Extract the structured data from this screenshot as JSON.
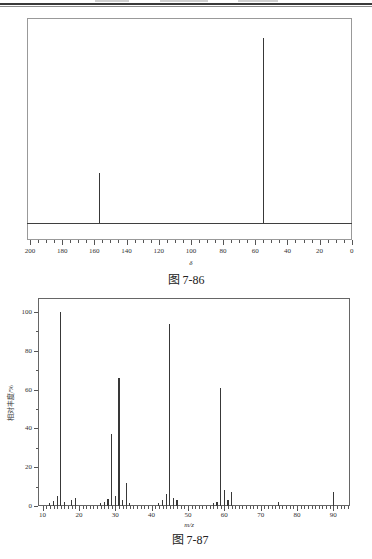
{
  "page": {
    "caption_nmr": "图 7-86",
    "caption_ms": "图 7-87"
  },
  "chart_data": [
    {
      "type": "line",
      "name": "carbon-13-nmr-spectrum",
      "title": "",
      "xlabel": "δ",
      "ylabel": "",
      "caption": "图 7-86",
      "x_axis": {
        "min": 0,
        "max": 200,
        "reversed": true,
        "major_step": 20,
        "minor_step": 5,
        "major_tick_labels": [
          "200",
          "180",
          "160",
          "140",
          "120",
          "100",
          "80",
          "60",
          "40",
          "20",
          "0"
        ]
      },
      "peaks": [
        {
          "x": 157,
          "rel_intensity": 27
        },
        {
          "x": 55,
          "rel_intensity": 100
        }
      ],
      "baseline": true,
      "grid": false,
      "frame": true
    },
    {
      "type": "bar",
      "name": "mass-spectrum",
      "title": "",
      "xlabel": "m/z",
      "ylabel": "相对丰度/%",
      "caption": "图 7-87",
      "x_axis": {
        "min": 10,
        "max": 94,
        "major_step": 10,
        "minor_step": 1,
        "major_tick_labels": [
          "10",
          "20",
          "30",
          "40",
          "50",
          "60",
          "70",
          "80",
          "90"
        ]
      },
      "y_axis": {
        "min": 0,
        "max": 106,
        "major_step": 20,
        "minor_step": 10,
        "major_tick_labels": [
          "0",
          "20",
          "40",
          "60",
          "80",
          "100"
        ]
      },
      "peaks": [
        {
          "mz": 12,
          "intensity": 1.5
        },
        {
          "mz": 13,
          "intensity": 2.5
        },
        {
          "mz": 14,
          "intensity": 5
        },
        {
          "mz": 15,
          "intensity": 100
        },
        {
          "mz": 16,
          "intensity": 2
        },
        {
          "mz": 18,
          "intensity": 3
        },
        {
          "mz": 19,
          "intensity": 4
        },
        {
          "mz": 26,
          "intensity": 1.5
        },
        {
          "mz": 27,
          "intensity": 2
        },
        {
          "mz": 28,
          "intensity": 3.5
        },
        {
          "mz": 29,
          "intensity": 37
        },
        {
          "mz": 30,
          "intensity": 5
        },
        {
          "mz": 31,
          "intensity": 66
        },
        {
          "mz": 32,
          "intensity": 3
        },
        {
          "mz": 33,
          "intensity": 12
        },
        {
          "mz": 34,
          "intensity": 1.5
        },
        {
          "mz": 42,
          "intensity": 1.5
        },
        {
          "mz": 43,
          "intensity": 3
        },
        {
          "mz": 44,
          "intensity": 6
        },
        {
          "mz": 45,
          "intensity": 94
        },
        {
          "mz": 46,
          "intensity": 4
        },
        {
          "mz": 47,
          "intensity": 3
        },
        {
          "mz": 57,
          "intensity": 1.5
        },
        {
          "mz": 58,
          "intensity": 2
        },
        {
          "mz": 59,
          "intensity": 61
        },
        {
          "mz": 60,
          "intensity": 8
        },
        {
          "mz": 61,
          "intensity": 3
        },
        {
          "mz": 62,
          "intensity": 7
        },
        {
          "mz": 75,
          "intensity": 2
        },
        {
          "mz": 90,
          "intensity": 7
        }
      ],
      "grid": false,
      "frame": true
    }
  ]
}
